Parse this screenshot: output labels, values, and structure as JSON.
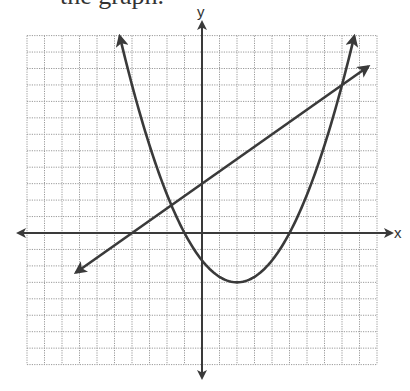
{
  "header": {
    "clipped_text": "the graph."
  },
  "chart_data": {
    "type": "line",
    "title": "",
    "xlabel": "x",
    "ylabel": "y",
    "xlim": [
      -10,
      10
    ],
    "ylim": [
      -8,
      12
    ],
    "grid": true,
    "grid_style": "dotted",
    "tick_labels": false,
    "series": [
      {
        "name": "parabola",
        "kind": "quadratic",
        "equation": "y = (x^2 - 4x - 5) / 3",
        "vertex": [
          2,
          -3
        ],
        "x_intercepts": [
          -1,
          5
        ],
        "y_intercept": -1.67,
        "x_range": [
          -4.7,
          8.7
        ],
        "arrows": "both"
      },
      {
        "name": "line",
        "kind": "linear",
        "equation": "y = 0.75x + 3",
        "slope": 0.75,
        "y_intercept": 3,
        "x_intercept": -4,
        "x_range": [
          -7.2,
          9.5
        ],
        "arrows": "both"
      }
    ],
    "intersections": [
      [
        -1.75,
        1.69
      ],
      [
        8,
        9
      ]
    ]
  },
  "colors": {
    "curve": "#3a3a3a",
    "axis": "#3a3a3a",
    "grid": "#9a9a9a",
    "background": "#ffffff"
  }
}
